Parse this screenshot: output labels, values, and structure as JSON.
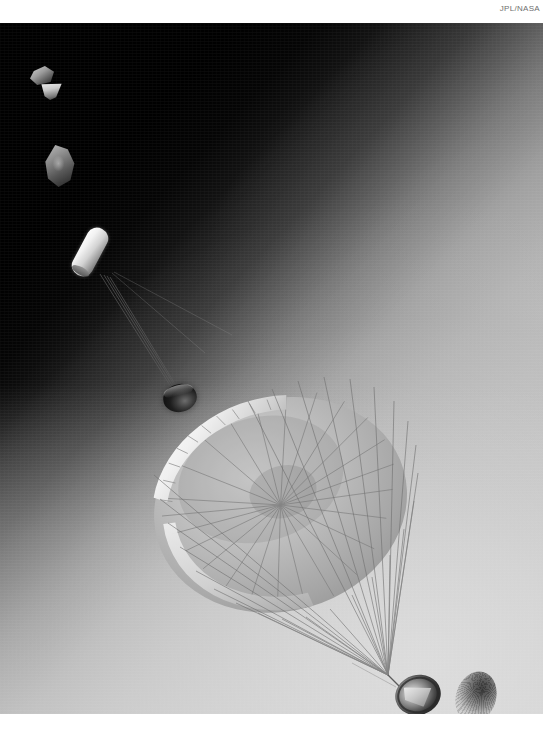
{
  "image": {
    "credit": "JPL/NASA",
    "alt_description": "Artist rendering of a spacecraft entry, descent and landing sequence over a planet",
    "frame": {
      "top_margin_px": 23,
      "left_px": 0,
      "width_px": 543,
      "height_px": 691
    },
    "colors": {
      "page_background": "#ffffff",
      "sky_dark": "#000000",
      "sky_mid": "#7e7e7e",
      "sky_light": "#c6c6c6",
      "haze_glow": "#e2e2e2",
      "credit_text": "#6e6e6e",
      "canopy_light": "#e8e8e8",
      "canopy_shade": "#9b9b9b",
      "line_color": "#6f6f6f",
      "capsule_dark": "#1e1e1e"
    },
    "elements": {
      "credit_label": "JPL/NASA",
      "debris_fragment_1": "debris-fragment",
      "debris_fragment_2": "debris-fragment",
      "debris_fragment_3": "debris-fragment",
      "deployment_bag": "parachute-deployment-bag",
      "descent_capsule": "descent-capsule",
      "parachute_canopy": "parachute-canopy",
      "suspension_lines": "suspension-lines",
      "backshell": "backshell-lander",
      "heat_shield": "separated-heat-shield"
    },
    "scene": {
      "canopy_gore_count": 24,
      "suspension_line_count": 26,
      "deployment_line_count": 4
    }
  }
}
